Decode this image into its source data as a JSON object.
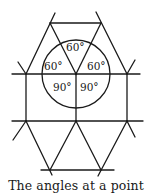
{
  "figure": {
    "caption": "The angles at a point",
    "angle_labels": {
      "top": "60°",
      "upper_left": "60°",
      "upper_right": "60°",
      "lower_left": "90°",
      "lower_right": "90°"
    },
    "angle_sum": "360°",
    "colors": {
      "line": "#1a1a1a",
      "background": "#ffffff"
    }
  }
}
